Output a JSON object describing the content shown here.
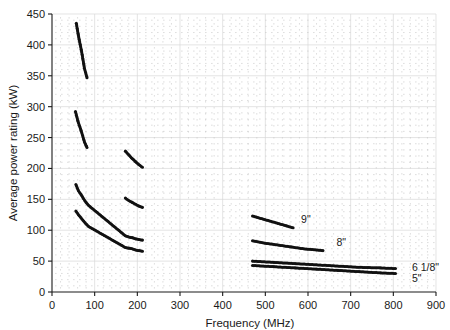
{
  "chart_data": {
    "type": "scatter",
    "title": "",
    "xlabel": "Frequency (MHz)",
    "ylabel": "Average power rating (kW)",
    "xlim": [
      0,
      900
    ],
    "ylim": [
      0,
      450
    ],
    "xticks": [
      0,
      100,
      200,
      300,
      400,
      500,
      600,
      700,
      800,
      900
    ],
    "yticks": [
      0,
      50,
      100,
      150,
      200,
      250,
      300,
      350,
      400,
      450
    ],
    "grid": true,
    "legend_position": "inline-right-of-series",
    "series": [
      {
        "name": "9\"",
        "label": "9\"",
        "label_x": 565,
        "label_y": 118,
        "points": [
          [
            57,
            435
          ],
          [
            63,
            411
          ],
          [
            69,
            391
          ],
          [
            76,
            362
          ],
          [
            82,
            347
          ],
          [
            172,
            228
          ],
          [
            180,
            222
          ],
          [
            188,
            216
          ],
          [
            196,
            211
          ],
          [
            204,
            206
          ],
          [
            212,
            202
          ],
          [
            470,
            123
          ],
          [
            490,
            119
          ],
          [
            510,
            115
          ],
          [
            530,
            111
          ],
          [
            550,
            107
          ],
          [
            565,
            104
          ]
        ]
      },
      {
        "name": "8\"",
        "label": "8\"",
        "label_x": 648,
        "label_y": 81,
        "points": [
          [
            55,
            292
          ],
          [
            61,
            276
          ],
          [
            68,
            262
          ],
          [
            76,
            243
          ],
          [
            82,
            234
          ],
          [
            172,
            152
          ],
          [
            180,
            148
          ],
          [
            188,
            145
          ],
          [
            196,
            142
          ],
          [
            204,
            139
          ],
          [
            212,
            137
          ],
          [
            470,
            83
          ],
          [
            500,
            79
          ],
          [
            530,
            76
          ],
          [
            560,
            73
          ],
          [
            590,
            70
          ],
          [
            620,
            68
          ],
          [
            635,
            67
          ]
        ]
      },
      {
        "name": "6 1/8\"",
        "label": "6 1/8\"",
        "label_x": 825,
        "label_y": 40,
        "points": [
          [
            56,
            174
          ],
          [
            62,
            164
          ],
          [
            68,
            158
          ],
          [
            74,
            151
          ],
          [
            80,
            145
          ],
          [
            86,
            140
          ],
          [
            172,
            91
          ],
          [
            180,
            89
          ],
          [
            188,
            88
          ],
          [
            196,
            86
          ],
          [
            204,
            85
          ],
          [
            212,
            84
          ],
          [
            470,
            50
          ],
          [
            520,
            48
          ],
          [
            570,
            46
          ],
          [
            620,
            44
          ],
          [
            670,
            42
          ],
          [
            720,
            40
          ],
          [
            770,
            39
          ],
          [
            805,
            38
          ]
        ]
      },
      {
        "name": "5\"",
        "label": "5\"",
        "label_x": 825,
        "label_y": 22,
        "points": [
          [
            56,
            131
          ],
          [
            62,
            125
          ],
          [
            68,
            120
          ],
          [
            74,
            115
          ],
          [
            80,
            110
          ],
          [
            86,
            106
          ],
          [
            172,
            72
          ],
          [
            180,
            71
          ],
          [
            188,
            70
          ],
          [
            196,
            68
          ],
          [
            204,
            67
          ],
          [
            212,
            66
          ],
          [
            470,
            43
          ],
          [
            520,
            41
          ],
          [
            570,
            39
          ],
          [
            620,
            37
          ],
          [
            670,
            35
          ],
          [
            720,
            33
          ],
          [
            770,
            31
          ],
          [
            805,
            30
          ]
        ]
      }
    ]
  }
}
